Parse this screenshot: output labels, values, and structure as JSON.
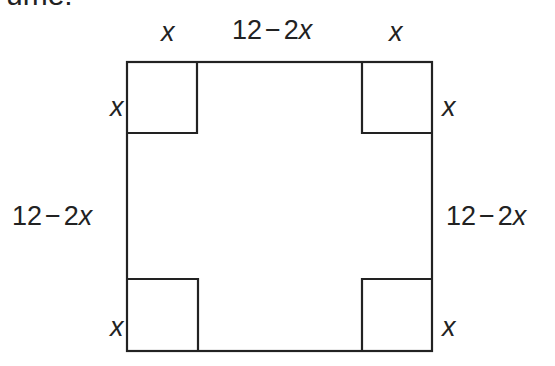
{
  "heading": "ume:",
  "diagram": {
    "outer_square": {
      "x": 127,
      "y": 62,
      "size": 305,
      "stroke": "#222222"
    },
    "corner_cut_size": 70,
    "labels": {
      "top_left": {
        "var": "x"
      },
      "top_middle": {
        "num": "12",
        "op": "−",
        "coef": "2",
        "var": "x"
      },
      "top_right": {
        "var": "x"
      },
      "left_upper": {
        "var": "x"
      },
      "left_middle": {
        "num": "12",
        "op": "−",
        "coef": "2",
        "var": "x"
      },
      "left_lower": {
        "var": "x"
      },
      "right_upper": {
        "var": "x"
      },
      "right_middle": {
        "num": "12",
        "op": "−",
        "coef": "2",
        "var": "x"
      },
      "right_lower": {
        "var": "x"
      }
    }
  }
}
